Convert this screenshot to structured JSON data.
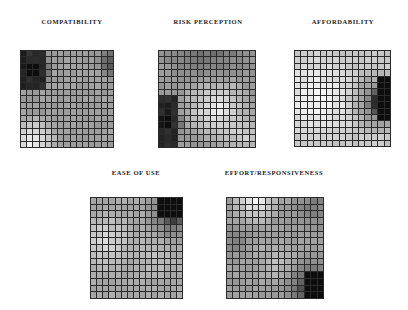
{
  "chart_data": {
    "type": "heatmap",
    "title": "",
    "grid_size": [
      15,
      15
    ],
    "value_range": [
      0,
      1
    ],
    "legend": "grayscale: dark = high value, light = low value",
    "panels": [
      {
        "id": "compatibility",
        "title": "COMPATIBILITY",
        "title_pos": [
          22,
          18,
          100
        ],
        "box": [
          20,
          50,
          94,
          98
        ],
        "description": "Dark cluster in top-left corner, light toward bottom-left, slightly dark at top-right edge",
        "hotspots": [
          {
            "col": 1.5,
            "row": 2.5,
            "radius": 3.2,
            "strength": 0.85,
            "shape": "block",
            "cols": [
              0,
              3
            ],
            "rows": [
              0,
              5
            ]
          },
          {
            "col": 14.5,
            "row": 1.5,
            "radius": 3.0,
            "strength": 0.35
          }
        ],
        "light_spots": [
          {
            "col": 1.5,
            "row": 13.5,
            "radius": 4.5,
            "strength": 0.35
          }
        ],
        "base": 0.62
      },
      {
        "id": "risk-perception",
        "title": "RISK PERCEPTION",
        "title_pos": [
          158,
          18,
          100
        ],
        "box": [
          158,
          50,
          98,
          98
        ],
        "description": "Dark strip on lower-left edge, light center and lower right, gray top",
        "hotspots": [
          {
            "col": 0.8,
            "row": 10.5,
            "radius": 2.6,
            "strength": 0.85,
            "shape": "block",
            "cols": [
              0,
              2
            ],
            "rows": [
              7,
              14
            ]
          },
          {
            "col": 7,
            "row": -2,
            "radius": 8,
            "strength": 0.2
          }
        ],
        "light_spots": [
          {
            "col": 8.5,
            "row": 8.5,
            "radius": 6,
            "strength": 0.35
          },
          {
            "col": 13,
            "row": 13,
            "radius": 4,
            "strength": 0.2
          }
        ],
        "base": 0.6
      },
      {
        "id": "affordability",
        "title": "AFFORDABILITY",
        "title_pos": [
          294,
          18,
          98
        ],
        "box": [
          294,
          50,
          97,
          97
        ],
        "description": "Light across most of the map, dark strip on right edge middle rows",
        "hotspots": [
          {
            "col": 14.2,
            "row": 7.5,
            "radius": 3.3,
            "strength": 0.9,
            "shape": "block",
            "cols": [
              13,
              14
            ],
            "rows": [
              4,
              10
            ]
          },
          {
            "col": 12.5,
            "row": 7.5,
            "radius": 5.5,
            "strength": 0.35
          }
        ],
        "light_spots": [
          {
            "col": 3,
            "row": 7,
            "radius": 8,
            "strength": 0.2
          }
        ],
        "base": 0.78
      },
      {
        "id": "ease-of-use",
        "title": "EASE OF USE",
        "title_pos": [
          90,
          169,
          92
        ],
        "box": [
          90,
          197,
          93,
          102
        ],
        "description": "Dark cluster top-right corner, light mid-left, gray elsewhere",
        "hotspots": [
          {
            "col": 13,
            "row": 1,
            "radius": 2.6,
            "strength": 0.85,
            "shape": "block",
            "cols": [
              11,
              14
            ],
            "rows": [
              0,
              2
            ]
          },
          {
            "col": 13,
            "row": 2,
            "radius": 5,
            "strength": 0.3
          }
        ],
        "light_spots": [
          {
            "col": 2,
            "row": 6,
            "radius": 5,
            "strength": 0.2
          },
          {
            "col": 10,
            "row": 8,
            "radius": 4,
            "strength": 0.1
          }
        ],
        "base": 0.66
      },
      {
        "id": "effort-responsiveness",
        "title": "EFFORT/RESPONSIVENESS",
        "title_pos": [
          216,
          169,
          116
        ],
        "box": [
          226,
          197,
          98,
          102
        ],
        "description": "Light top-left row, dark cluster bottom-right corner, gray mottled middle",
        "hotspots": [
          {
            "col": 13.2,
            "row": 13.2,
            "radius": 2.6,
            "strength": 0.85,
            "shape": "block",
            "cols": [
              12,
              14
            ],
            "rows": [
              11,
              14
            ]
          },
          {
            "col": 13,
            "row": 13,
            "radius": 5.5,
            "strength": 0.3
          },
          {
            "col": 13,
            "row": 1,
            "radius": 4,
            "strength": 0.15
          },
          {
            "col": 1,
            "row": 6,
            "radius": 3,
            "strength": 0.12
          }
        ],
        "light_spots": [
          {
            "col": 4,
            "row": 0,
            "radius": 4,
            "strength": 0.35
          },
          {
            "col": 7,
            "row": 9,
            "radius": 4,
            "strength": 0.12
          }
        ],
        "base": 0.62
      }
    ]
  }
}
